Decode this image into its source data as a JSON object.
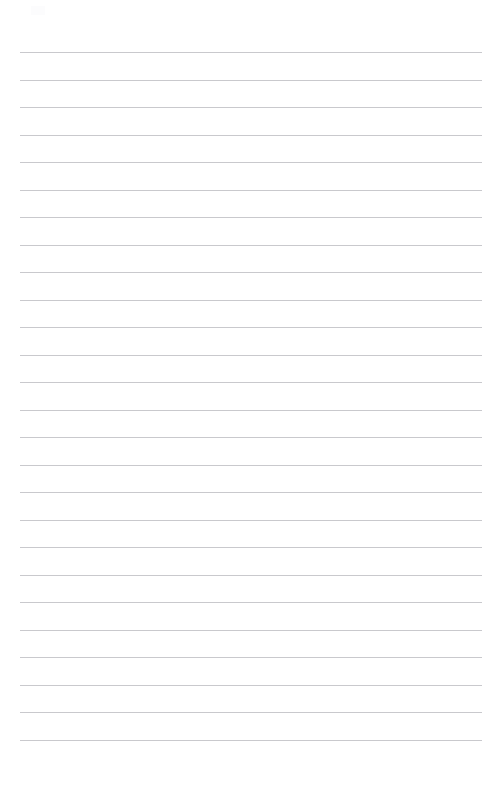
{
  "document": {
    "type": "ruled-notepad-page",
    "title": "",
    "page_number": "",
    "background_color": "#ffffff",
    "rule_color": "#c9c9cd",
    "rule_thickness_px": 1,
    "page_width_px": 484,
    "page_height_px": 788,
    "margin_left_px": 20,
    "margin_right_px": 2,
    "first_rule_y_px": 52,
    "rule_spacing_px": 27.5,
    "rule_count": 25,
    "header_area_height_px": 52,
    "footer_area_height_px": 50,
    "has_vertical_margin_rule": false,
    "has_header_text": false,
    "has_footer_text": false,
    "is_blank": true
  },
  "corner_mark": {
    "label": "faint-scan-artifact",
    "x_px": 31,
    "y_px": 6,
    "width_px": 14,
    "height_px": 9
  },
  "lines": [
    {
      "index": 1,
      "y_px": 52,
      "text": ""
    },
    {
      "index": 2,
      "y_px": 79.5,
      "text": ""
    },
    {
      "index": 3,
      "y_px": 107,
      "text": ""
    },
    {
      "index": 4,
      "y_px": 134.5,
      "text": ""
    },
    {
      "index": 5,
      "y_px": 162,
      "text": ""
    },
    {
      "index": 6,
      "y_px": 189.5,
      "text": ""
    },
    {
      "index": 7,
      "y_px": 217,
      "text": ""
    },
    {
      "index": 8,
      "y_px": 244.5,
      "text": ""
    },
    {
      "index": 9,
      "y_px": 272,
      "text": ""
    },
    {
      "index": 10,
      "y_px": 299.5,
      "text": ""
    },
    {
      "index": 11,
      "y_px": 327,
      "text": ""
    },
    {
      "index": 12,
      "y_px": 354.5,
      "text": ""
    },
    {
      "index": 13,
      "y_px": 382,
      "text": ""
    },
    {
      "index": 14,
      "y_px": 409.5,
      "text": ""
    },
    {
      "index": 15,
      "y_px": 437,
      "text": ""
    },
    {
      "index": 16,
      "y_px": 464.5,
      "text": ""
    },
    {
      "index": 17,
      "y_px": 492,
      "text": ""
    },
    {
      "index": 18,
      "y_px": 519.5,
      "text": ""
    },
    {
      "index": 19,
      "y_px": 547,
      "text": ""
    },
    {
      "index": 20,
      "y_px": 574.5,
      "text": ""
    },
    {
      "index": 21,
      "y_px": 602,
      "text": ""
    },
    {
      "index": 22,
      "y_px": 629.5,
      "text": ""
    },
    {
      "index": 23,
      "y_px": 657,
      "text": ""
    },
    {
      "index": 24,
      "y_px": 684.5,
      "text": ""
    },
    {
      "index": 25,
      "y_px": 712,
      "text": ""
    },
    {
      "index": 26,
      "y_px": 739.5,
      "text": ""
    }
  ]
}
